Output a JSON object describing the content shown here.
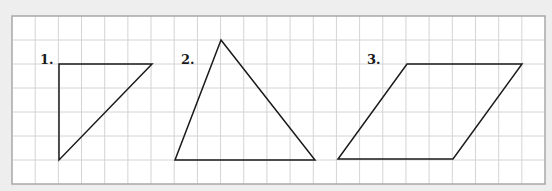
{
  "grid": {
    "x0": 12,
    "y0": 16,
    "x1": 545,
    "y1": 184,
    "cell_w": 23.2,
    "cell_h": 23.9,
    "cols": 23,
    "rows": 7,
    "line_color": "#d4d4d4",
    "border_color": "#a8a8a8",
    "background": "#ffffff"
  },
  "figures": [
    {
      "label": "1.",
      "label_pos": [
        40,
        53
      ],
      "shape": "right-triangle",
      "points": [
        [
          59,
          64
        ],
        [
          152,
          64
        ],
        [
          59,
          160
        ]
      ]
    },
    {
      "label": "2.",
      "label_pos": [
        181,
        53
      ],
      "shape": "triangle",
      "points": [
        [
          221,
          40
        ],
        [
          315,
          160
        ],
        [
          175,
          160
        ]
      ]
    },
    {
      "label": "3.",
      "label_pos": [
        367,
        53
      ],
      "shape": "parallelogram",
      "points": [
        [
          407,
          64
        ],
        [
          522,
          64
        ],
        [
          453,
          159
        ],
        [
          338,
          159
        ]
      ]
    }
  ],
  "stroke_color": "#1a1a1a",
  "page_background": "#eeeeee"
}
